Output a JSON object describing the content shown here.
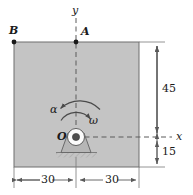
{
  "figure": {
    "type": "engineering-mechanics-diagram",
    "plate": {
      "fill_color": "#c4c4c4",
      "edge_color": "#6e6e6e"
    },
    "points": [
      {
        "id": "B",
        "label": "B"
      },
      {
        "id": "A",
        "label": "A"
      },
      {
        "id": "O",
        "label": "O"
      }
    ],
    "axes": [
      {
        "id": "y-axis",
        "label": "y"
      },
      {
        "id": "x-axis",
        "label": "x"
      }
    ],
    "kinematics": [
      {
        "id": "angular-acceleration",
        "label": "α"
      },
      {
        "id": "angular-velocity",
        "label": "ω"
      }
    ],
    "dimensions": [
      {
        "id": "dim-left-30",
        "label": "30"
      },
      {
        "id": "dim-right-30",
        "label": "30"
      },
      {
        "id": "dim-upper-45",
        "label": "45"
      },
      {
        "id": "dim-lower-15",
        "label": "15"
      }
    ]
  }
}
